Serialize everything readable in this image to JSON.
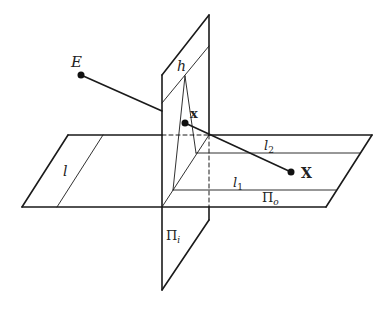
{
  "diagram": {
    "stroke_color": "#1a1a1a",
    "labels": {
      "eye": "E",
      "horizon": "h",
      "image_point": "x",
      "object_point": "X",
      "line_l": "l",
      "line_l1": "l",
      "line_l1_sub": "1",
      "line_l2": "l",
      "line_l2_sub": "2",
      "object_plane": "Π",
      "object_plane_sub": "o",
      "image_plane": "Π",
      "image_plane_sub": "i"
    },
    "elements": [
      {
        "name": "ground-plane",
        "label": "Π_o"
      },
      {
        "name": "picture-plane",
        "label": "Π_i"
      },
      {
        "name": "horizon-line",
        "label": "h"
      },
      {
        "name": "line-l",
        "label": "l"
      },
      {
        "name": "line-l1",
        "label": "l_1"
      },
      {
        "name": "line-l2",
        "label": "l_2"
      },
      {
        "name": "eye-point",
        "label": "E"
      },
      {
        "name": "image-point",
        "label": "x"
      },
      {
        "name": "object-point",
        "label": "X"
      }
    ]
  }
}
